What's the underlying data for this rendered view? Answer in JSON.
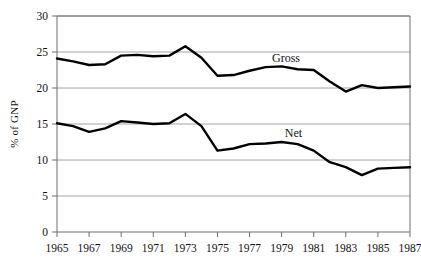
{
  "axis": {
    "ylabel": "% of GNP",
    "yticks": [
      "0",
      "5",
      "10",
      "15",
      "20",
      "25",
      "30"
    ],
    "xticks": [
      "1965",
      "1967",
      "1969",
      "1971",
      "1973",
      "1975",
      "1977",
      "1979",
      "1981",
      "1983",
      "1985",
      "1987"
    ]
  },
  "labels": {
    "gross": "Gross",
    "net": "Net"
  },
  "colors": {
    "line": "#000000",
    "grid": "#9a9a9a",
    "frame": "#6e6e6e",
    "text": "#111111"
  },
  "chart_data": {
    "type": "line",
    "title": "",
    "xlabel": "",
    "ylabel": "% of GNP",
    "xlim": [
      1965,
      1987
    ],
    "ylim": [
      0,
      30
    ],
    "yticks": [
      0,
      5,
      10,
      15,
      20,
      25,
      30
    ],
    "xticks": [
      1965,
      1967,
      1969,
      1971,
      1973,
      1975,
      1977,
      1979,
      1981,
      1983,
      1985,
      1987
    ],
    "grid": true,
    "legend": "inline-annotations",
    "x": [
      1965,
      1966,
      1967,
      1968,
      1969,
      1970,
      1971,
      1972,
      1973,
      1974,
      1975,
      1976,
      1977,
      1978,
      1979,
      1980,
      1981,
      1982,
      1983,
      1984,
      1985,
      1986,
      1987
    ],
    "series": [
      {
        "name": "Gross",
        "label_position": {
          "x": 1978.4,
          "y": 23.6
        },
        "values": [
          24.1,
          23.7,
          23.2,
          23.3,
          24.5,
          24.6,
          24.4,
          24.5,
          25.8,
          24.2,
          21.7,
          21.8,
          22.4,
          22.9,
          23.0,
          22.6,
          22.5,
          20.9,
          19.5,
          20.4,
          20.0,
          20.1,
          20.2
        ]
      },
      {
        "name": "Net",
        "label_position": {
          "x": 1979.2,
          "y": 13.2
        },
        "values": [
          15.1,
          14.7,
          13.9,
          14.4,
          15.4,
          15.2,
          15.0,
          15.1,
          16.4,
          14.7,
          11.3,
          11.6,
          12.2,
          12.3,
          12.5,
          12.2,
          11.3,
          9.7,
          9.0,
          7.9,
          8.8,
          8.9,
          9.0
        ]
      }
    ]
  }
}
